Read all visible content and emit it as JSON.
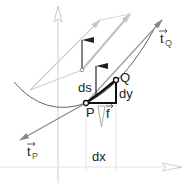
{
  "diagram": {
    "labels": {
      "tangent_q": "t",
      "tangent_q_sub": "Q",
      "tangent_p": "t",
      "tangent_p_sub": "P",
      "point_q": "Q",
      "point_p": "P",
      "ds": "ds",
      "dy": "dy",
      "dx": "dx",
      "force": "f"
    },
    "colors": {
      "curve": "#555555",
      "arc_segment": "#111111",
      "tangent": "#777777",
      "axis": "#c8c8c8",
      "light_arrows": "#bbbbbb"
    }
  }
}
